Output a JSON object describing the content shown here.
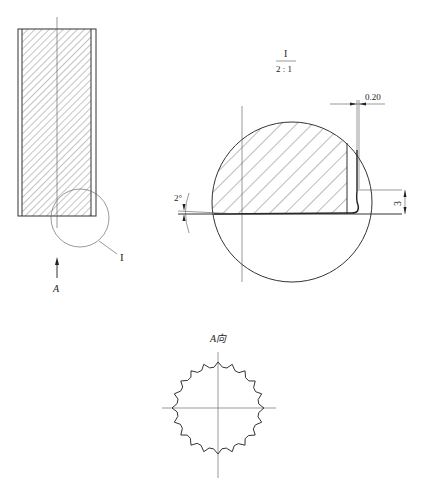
{
  "drawing": {
    "type": "mechanical engineering drawing",
    "views": {
      "main_section": {
        "detail_callout_label": "I",
        "view_direction_label": "A"
      },
      "detail_view": {
        "label": "I",
        "scale": "2 : 1",
        "dimensions": {
          "gap_width": "0.20",
          "height": "3",
          "angle": "2°"
        }
      },
      "end_view": {
        "label": "A向",
        "tooth_count": 20
      }
    }
  }
}
